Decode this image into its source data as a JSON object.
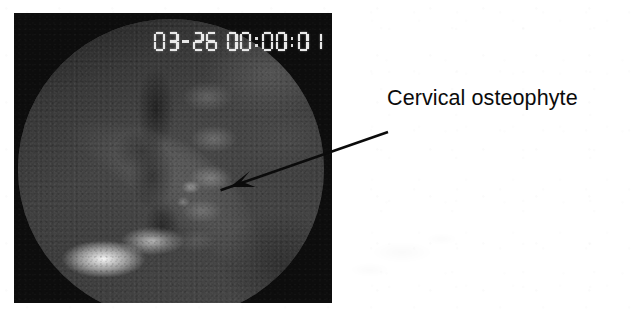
{
  "figure": {
    "background_color": "#ffffff",
    "width": 636,
    "height": 316
  },
  "fluoroscopy_panel": {
    "frame_color": "#0d0d0d",
    "field_shape": "circle",
    "modality": "fluoroscopy",
    "view": "lateral cervical spine"
  },
  "timestamp_overlay": {
    "full_text": "03-26 00:00:01",
    "date": "03-26",
    "time": "00:00:01",
    "date_digits": [
      "0",
      "3",
      "2",
      "6"
    ],
    "time_digits": [
      "0",
      "0",
      "0",
      "0",
      "0",
      "1"
    ],
    "style": "seven-segment-lcd",
    "color": "#e9e9e9",
    "clipped_at_right_edge": true
  },
  "annotation": {
    "label": "Cervical osteophyte",
    "color": "#0b0b0b",
    "arrow": {
      "tail_x": 388,
      "tail_y": 132,
      "tip_x": 230,
      "tip_y": 187
    }
  }
}
